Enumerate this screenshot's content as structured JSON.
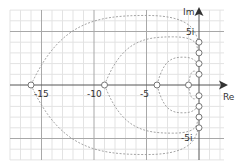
{
  "diagram": {
    "type": "complex-plane-root-locus",
    "axes": {
      "x_label": "Re",
      "y_label": "Im",
      "x_ticks": [
        {
          "value": -15,
          "label": "-15"
        },
        {
          "value": -10,
          "label": "-10"
        },
        {
          "value": -5,
          "label": "-5"
        }
      ],
      "y_ticks": [
        {
          "value": 5,
          "label": "5i"
        },
        {
          "value": -5,
          "label": "-5i"
        }
      ],
      "x_range": [
        -18,
        6
      ],
      "y_range": [
        -8,
        7.5
      ]
    },
    "grid": {
      "minor_step": 1,
      "major_step": 5
    },
    "points_real_axis": [
      -16,
      -9,
      -4,
      -1
    ],
    "points_imag_axis": [
      4,
      3,
      2,
      1,
      -1,
      -2,
      -3,
      -4
    ],
    "curves": [
      {
        "from": -16,
        "to_im": 4,
        "peak_re": -5,
        "peak_im": 6.5
      },
      {
        "from": -9,
        "to_im": 3,
        "peak_re": -2.5,
        "peak_im": 4.5
      },
      {
        "from": -4,
        "to_im": 2,
        "peak_re": -1.5,
        "peak_im": 2.6
      },
      {
        "from": -1,
        "to_im": 1,
        "peak_re": -0.4,
        "peak_im": 1.3
      }
    ],
    "colors": {
      "grid_minor": "#e3e3e3",
      "grid_major": "#a8a8a8",
      "axis": "#555555",
      "curve": "#9a9a9a",
      "marker": "#777777"
    }
  },
  "chart_data": {
    "type": "scatter",
    "title": "",
    "xlabel": "Re",
    "ylabel": "Im",
    "x_tick_labels": [
      "-15",
      "-10",
      "-5"
    ],
    "y_tick_labels": [
      "5i",
      "-5i"
    ],
    "series": [
      {
        "name": "real-axis points",
        "x": [
          -16,
          -9,
          -4,
          -1
        ],
        "y": [
          0,
          0,
          0,
          0
        ]
      },
      {
        "name": "imag-axis points",
        "x": [
          0,
          0,
          0,
          0,
          0,
          0,
          0,
          0
        ],
        "y": [
          4,
          3,
          2,
          1,
          -1,
          -2,
          -3,
          -4
        ]
      }
    ],
    "grid": true
  }
}
